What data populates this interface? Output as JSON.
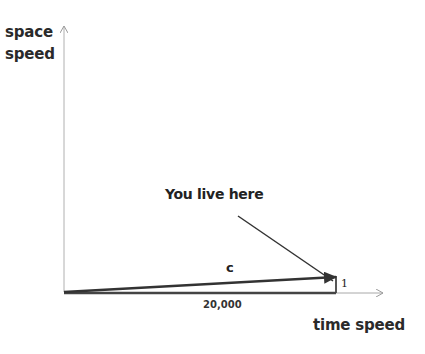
{
  "axes": {
    "y_label_line1": "space",
    "y_label_line2": "speed",
    "x_label": "time speed"
  },
  "annotations": {
    "pointer_text": "You live here",
    "vector_label": "c",
    "horizontal_value": "20,000",
    "vertical_value": "1"
  },
  "colors": {
    "background": "#ffffff",
    "axis": "#b0b0b0",
    "vector": "#333333",
    "text": "#222222"
  }
}
